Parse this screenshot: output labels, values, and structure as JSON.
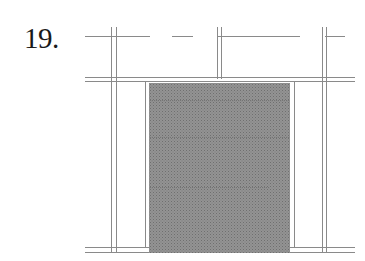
{
  "figure": {
    "number_label": "19.",
    "colors": {
      "line": "#8a8a8a",
      "fill": "#8f8f8f",
      "fill_dots": "#6e6e6e",
      "background": "#ffffff"
    }
  }
}
